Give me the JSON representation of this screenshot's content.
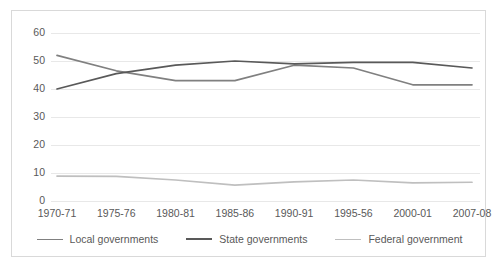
{
  "chart_data": {
    "type": "line",
    "title": "",
    "subtitle": "",
    "xlabel": "",
    "ylabel": "",
    "ylim": [
      0,
      60
    ],
    "yticks": [
      0,
      10,
      20,
      30,
      40,
      50,
      60
    ],
    "ytick_labels": [
      "0",
      "10",
      "20",
      "30",
      "40",
      "50",
      "60"
    ],
    "grid": true,
    "grid_axis": "y",
    "legend_position": "bottom",
    "categories": [
      "1970-71",
      "1975-76",
      "1980-81",
      "1985-86",
      "1990-91",
      "1995-56",
      "2000-01",
      "2007-08"
    ],
    "series": [
      {
        "name": "Local governments",
        "color": "#808080",
        "values": [
          52.0,
          46.5,
          43.0,
          43.0,
          48.5,
          47.5,
          41.5,
          41.5
        ]
      },
      {
        "name": "State governments",
        "color": "#595959",
        "values": [
          40.0,
          45.5,
          48.5,
          50.0,
          49.0,
          49.5,
          49.5,
          47.5
        ]
      },
      {
        "name": "Federal government",
        "color": "#bfbfbf",
        "values": [
          8.9,
          8.8,
          7.5,
          5.7,
          6.8,
          7.5,
          6.5,
          6.7
        ]
      }
    ]
  },
  "legend": {
    "items": [
      {
        "label": "Local governments"
      },
      {
        "label": "State governments"
      },
      {
        "label": "Federal government"
      }
    ]
  },
  "axis": {
    "y_labels": [
      "60",
      "50",
      "40",
      "30",
      "20",
      "10",
      "0"
    ],
    "x_labels": [
      "1970-71",
      "1975-76",
      "1980-81",
      "1985-86",
      "1990-91",
      "1995-56",
      "2000-01",
      "2007-08"
    ]
  },
  "colors": {
    "frame_border": "#d9d9d9",
    "gridline": "#e8e8e8",
    "axis_text": "#595959",
    "local": "#808080",
    "state": "#595959",
    "federal": "#bfbfbf",
    "background": "#ffffff"
  }
}
